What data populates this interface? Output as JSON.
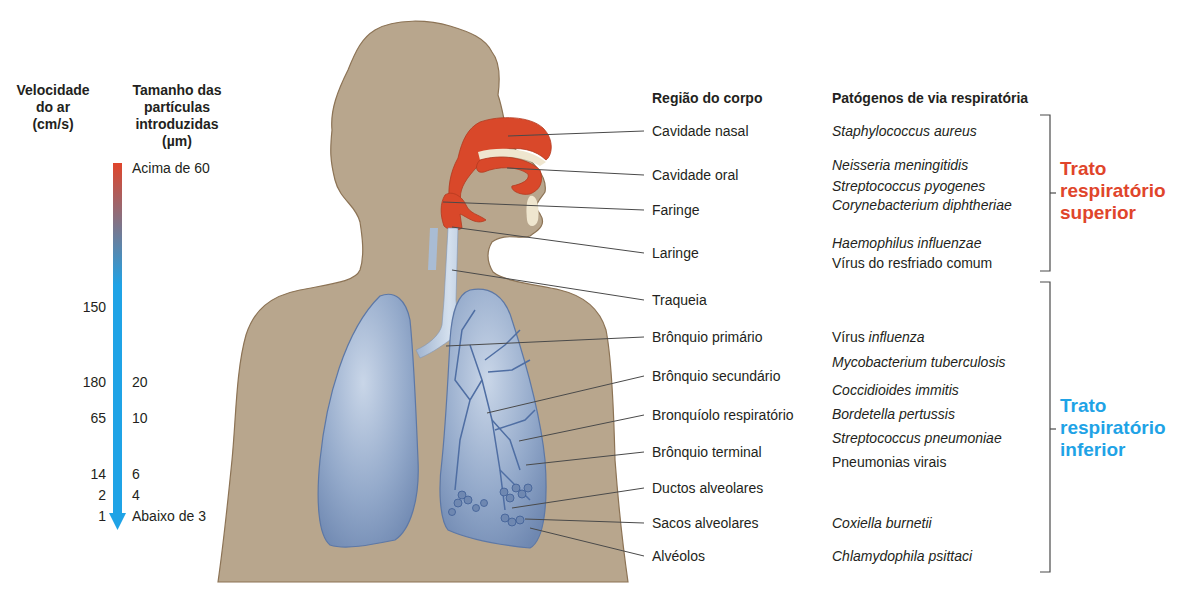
{
  "left_scale": {
    "velocity_header": [
      "Velocidade",
      "do ar",
      "(cm/s)"
    ],
    "size_header": [
      "Tamanho das",
      "partículas",
      "introduzidas",
      "(µm)"
    ],
    "gradient": {
      "top_color": "#e0452b",
      "bottom_color": "#1fa3e6"
    },
    "velocity_values": [
      {
        "value": "150",
        "y": 307
      },
      {
        "value": "180",
        "y": 382
      },
      {
        "value": "65",
        "y": 418
      },
      {
        "value": "14",
        "y": 474
      },
      {
        "value": "2",
        "y": 495
      },
      {
        "value": "1",
        "y": 516
      }
    ],
    "size_values": [
      {
        "value": "Acima de 60",
        "y": 168
      },
      {
        "value": "20",
        "y": 382
      },
      {
        "value": "10",
        "y": 418
      },
      {
        "value": "6",
        "y": 474
      },
      {
        "value": "4",
        "y": 495
      },
      {
        "value": "Abaixo de 3",
        "y": 516
      }
    ]
  },
  "headers": {
    "region": "Região do corpo",
    "pathogens": "Patógenos de via respiratória"
  },
  "regions": [
    {
      "label": "Cavidade nasal",
      "y": 131
    },
    {
      "label": "Cavidade oral",
      "y": 175
    },
    {
      "label": "Faringe",
      "y": 210
    },
    {
      "label": "Laringe",
      "y": 253
    },
    {
      "label": "Traqueia",
      "y": 300
    },
    {
      "label": "Brônquio primário",
      "y": 337
    },
    {
      "label": "Brônquio secundário",
      "y": 376
    },
    {
      "label": "Bronquíolo respiratório",
      "y": 415
    },
    {
      "label": "Brônquio terminal",
      "y": 452
    },
    {
      "label": "Ductos alveolares",
      "y": 488
    },
    {
      "label": "Sacos alveolares",
      "y": 523
    },
    {
      "label": "Alvéolos",
      "y": 556
    }
  ],
  "pathogens": [
    {
      "prefix": "",
      "name": "Staphylococcus aureus",
      "y": 131
    },
    {
      "prefix": "",
      "name": "Neisseria meningitidis",
      "y": 165
    },
    {
      "prefix": "",
      "name": "Streptococcus pyogenes",
      "y": 186
    },
    {
      "prefix": "",
      "name": "Corynebacterium diphtheriae",
      "y": 205
    },
    {
      "prefix": "",
      "name": "Haemophilus influenzae",
      "y": 243
    },
    {
      "prefix": "Vírus do resfriado comum",
      "name": "",
      "y": 263
    },
    {
      "prefix": "Vírus ",
      "name": "influenza",
      "y": 337
    },
    {
      "prefix": "",
      "name": "Mycobacterium tuberculosis",
      "y": 362
    },
    {
      "prefix": "",
      "name": "Coccidioides immitis",
      "y": 390
    },
    {
      "prefix": "",
      "name": "Bordetella pertussis",
      "y": 414
    },
    {
      "prefix": "",
      "name": "Streptococcus pneumoniae",
      "y": 438
    },
    {
      "prefix": "Pneumonias virais",
      "name": "",
      "y": 462
    },
    {
      "prefix": "",
      "name": "Coxiella burnetii",
      "y": 523
    },
    {
      "prefix": "",
      "name": "Chlamydophila psittaci",
      "y": 556
    }
  ],
  "tracts": {
    "upper": {
      "lines": [
        "Trato",
        "respiratório",
        "superior"
      ],
      "color": "#e0452b"
    },
    "lower": {
      "lines": [
        "Trato",
        "respiratório",
        "inferior"
      ],
      "color": "#1fa3e6"
    }
  },
  "colors": {
    "body": "#b8a68d",
    "body_outline": "#8c7355",
    "upper_airway": "#d9482a",
    "lungs": "#8fa6c8",
    "trachea": "#b7c9df",
    "leader_line": "#4a4a4a"
  }
}
